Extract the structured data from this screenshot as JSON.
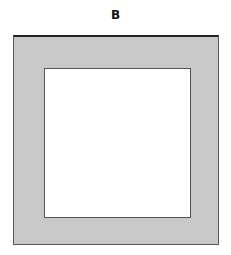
{
  "figure": {
    "label": "B",
    "shapes": [
      {
        "name": "outer-square",
        "fill": "#c9c9c9",
        "stroke": "#555555"
      },
      {
        "name": "inner-square",
        "fill": "#ffffff",
        "stroke": "#555555"
      }
    ]
  }
}
